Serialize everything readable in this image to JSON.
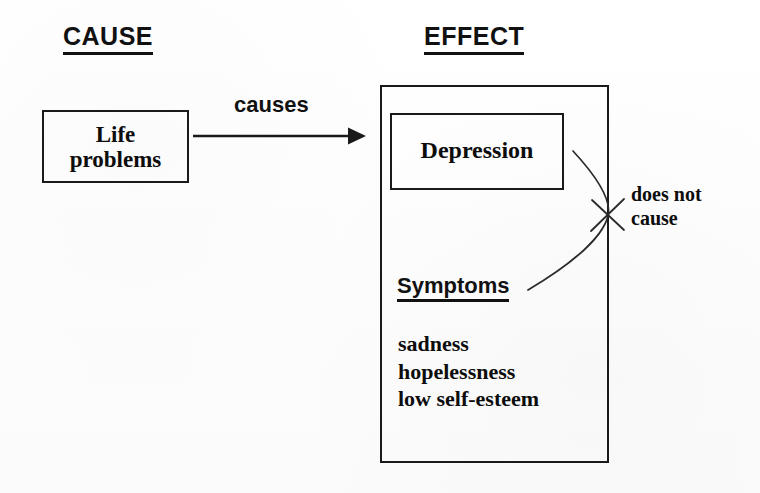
{
  "diagram": {
    "title_cause": "CAUSE",
    "title_effect": "EFFECT",
    "arrow_label": "causes",
    "negation_label_line1": "does not",
    "negation_label_line2": "cause",
    "cause_box": {
      "line1": "Life",
      "line2": "problems"
    },
    "effect_box": {
      "depression_label": "Depression",
      "symptoms_heading": "Symptoms",
      "symptoms": [
        "sadness",
        "hopelessness",
        "low self-esteem"
      ]
    },
    "colors": {
      "ink": "#111111",
      "paper": "#fefefe",
      "stroke": "#1a1a1a"
    }
  }
}
